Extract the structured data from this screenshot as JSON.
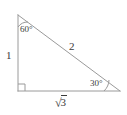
{
  "figure": {
    "type": "right-triangle-diagram",
    "stroke_color": "#9a9a9a",
    "text_color": "#3a3a3a",
    "background_color": "#ffffff",
    "vertices": {
      "top": {
        "x": 18,
        "y": 15
      },
      "bottom_left": {
        "x": 18,
        "y": 91
      },
      "bottom_right": {
        "x": 120,
        "y": 91
      }
    },
    "angles": {
      "top": "60°",
      "bottom_right": "30°",
      "bottom_left": "right angle marker"
    },
    "sides": {
      "vertical_leg": "1",
      "hypotenuse": "2",
      "base_radical_sign": "√",
      "base_radicand": "3"
    }
  }
}
